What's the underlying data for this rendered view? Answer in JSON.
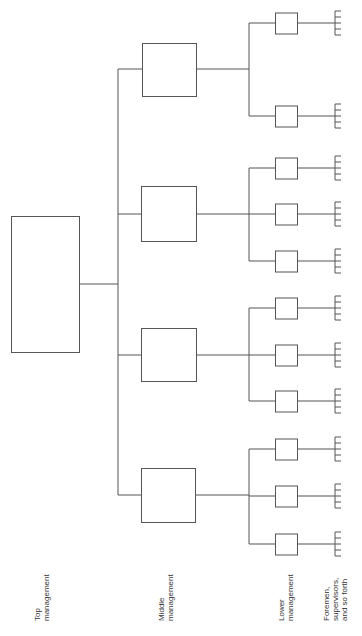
{
  "diagram": {
    "line_color": "#555555",
    "levels": [
      {
        "id": "top",
        "label_lines": [
          "Top",
          "management"
        ]
      },
      {
        "id": "middle",
        "label_lines": [
          "Middle",
          "management"
        ]
      },
      {
        "id": "lower",
        "label_lines": [
          "Lower",
          "management"
        ]
      },
      {
        "id": "foremen",
        "label_lines": [
          "Foremen,",
          "supervisors,",
          "and so forth"
        ]
      }
    ],
    "top_box": {
      "x": 11,
      "y": 216,
      "w": 68,
      "h": 136
    },
    "trunk_x": 118,
    "middle_groups": [
      {
        "box": {
          "x": 142,
          "y": 43,
          "w": 54,
          "h": 53
        },
        "cy": 69,
        "lower_cy": [
          23,
          116
        ]
      },
      {
        "box": {
          "x": 141,
          "y": 186,
          "w": 55,
          "h": 55
        },
        "cy": 214,
        "lower_cy": [
          168,
          214,
          261
        ]
      },
      {
        "box": {
          "x": 141,
          "y": 328,
          "w": 55,
          "h": 53
        },
        "cy": 355,
        "lower_cy": [
          308,
          355,
          401
        ]
      },
      {
        "box": {
          "x": 141,
          "y": 468,
          "w": 54,
          "h": 54
        },
        "cy": 495,
        "lower_cy": [
          449,
          496,
          544
        ]
      }
    ],
    "lower_branch_x": 249,
    "lower_box": {
      "x": 275,
      "w": 22,
      "h": 21
    },
    "comb": {
      "x": 335,
      "tick_len": 6,
      "span": 24,
      "ticks": 5
    }
  }
}
